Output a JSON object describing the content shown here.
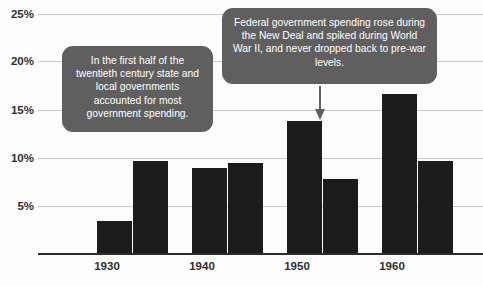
{
  "chart_data": {
    "type": "bar",
    "title": "",
    "subtitle": "",
    "xlabel": "",
    "ylabel": "",
    "categories": [
      "1930",
      "1940",
      "1950",
      "1960"
    ],
    "ylim": [
      0,
      25
    ],
    "y_ticks": [
      5,
      10,
      15,
      20,
      25
    ],
    "y_tick_labels": [
      "5%",
      "10%",
      "15%",
      "20%",
      "25%"
    ],
    "grid": true,
    "legend": "none",
    "series": [
      {
        "name": "Federal government spending",
        "values": [
          3.3,
          8.9,
          13.8,
          16.6
        ],
        "color": "#1c1c1c"
      },
      {
        "name": "State and local government spending",
        "values": [
          9.6,
          9.4,
          7.7,
          9.6
        ],
        "color": "#1c1c1c"
      }
    ],
    "annotations": [
      {
        "id": "callout-state-local",
        "text": "In the first half of the twentieth century state and local governments accounted for most government spending.",
        "background": "#5f5f5f",
        "text_color": "#ffffff"
      },
      {
        "id": "callout-federal",
        "text": "Federal government spending rose during the New Deal and spiked during World War II, and never dropped back to pre-war levels.",
        "background": "#5f5f5f",
        "text_color": "#ffffff",
        "pointer": "down-arrow-to-1950-federal-bar"
      }
    ]
  },
  "axes": {
    "y_labels": [
      "25%",
      "20%",
      "15%",
      "10%",
      "5%"
    ],
    "x_labels": [
      "1930",
      "1940",
      "1950",
      "1960"
    ]
  },
  "colors": {
    "bar": "#1c1c1c",
    "gridline": "#c9c9c9",
    "baseline": "#2b2b2b",
    "callout_bg": "#5f5f5f",
    "callout_text": "#ffffff",
    "page_bg": "#fdfdfd",
    "tick_text": "#2f2f2f"
  },
  "icons": {
    "pointer": "down-arrow-icon"
  }
}
